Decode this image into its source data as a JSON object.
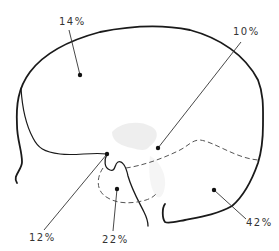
{
  "diagram": {
    "type": "anatomical-region-percentage-diagram",
    "colors": {
      "outline": "#1a1a1a",
      "leader": "#333333",
      "dashed": "#555555",
      "shading": "#e6e6e6",
      "text": "#333333"
    },
    "regions": [
      {
        "id": "upper",
        "label": "14%",
        "label_pos": [
          66,
          16
        ],
        "dot": [
          80,
          75
        ],
        "leader_start": [
          69,
          30
        ]
      },
      {
        "id": "central",
        "label": "10%",
        "label_pos": [
          236,
          27
        ],
        "dot": [
          158,
          148
        ],
        "leader_start": [
          241,
          42
        ]
      },
      {
        "id": "posterior-junction",
        "label": "12%",
        "label_pos": [
          30,
          234
        ],
        "dot": [
          107,
          154
        ],
        "leader_start": [
          44,
          230
        ]
      },
      {
        "id": "inferior-pocket",
        "label": "22%",
        "label_pos": [
          103,
          234
        ],
        "dot": [
          117,
          189
        ],
        "leader_start": [
          113,
          231
        ]
      },
      {
        "id": "anterior-lower",
        "label": "42%",
        "label_pos": [
          245,
          218
        ],
        "dot": [
          214,
          190
        ],
        "leader_start": [
          245,
          220
        ]
      }
    ]
  }
}
